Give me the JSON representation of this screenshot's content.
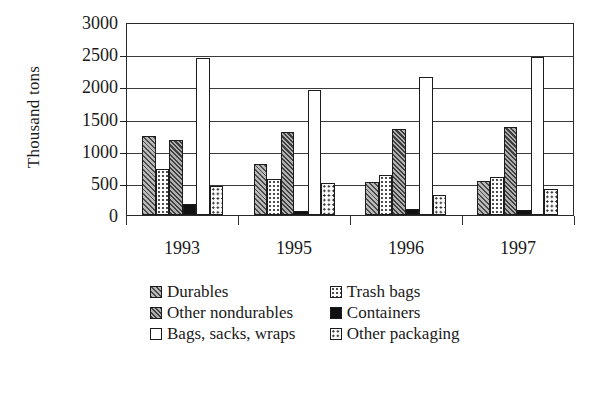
{
  "chart_data": {
    "type": "bar",
    "title": "",
    "subtitle": "",
    "xlabel": "",
    "ylabel": "Thousand tons",
    "categories": [
      "1993",
      "1995",
      "1996",
      "1997"
    ],
    "ylim": [
      0,
      3000
    ],
    "ytick_values": [
      3000,
      2500,
      2000,
      1500,
      1000,
      500,
      0
    ],
    "ytick_labels": [
      "3000",
      "2500",
      "2000",
      "1500",
      "1000",
      "500",
      "0"
    ],
    "grid": true,
    "grid_axis": "y",
    "legend_position": "below",
    "series": [
      {
        "name": "Durables",
        "pattern": "diagonal-hatch-dark",
        "values": [
          1230,
          800,
          520,
          530
        ]
      },
      {
        "name": "Trash bags",
        "pattern": "fine-dots-light",
        "values": [
          715,
          555,
          620,
          595
        ]
      },
      {
        "name": "Other nondurables",
        "pattern": "diagonal-hatch-dense",
        "values": [
          1160,
          1290,
          1340,
          1370
        ]
      },
      {
        "name": "Containers",
        "pattern": "solid-black",
        "values": [
          175,
          55,
          90,
          85
        ]
      },
      {
        "name": "Bags, sacks, wraps",
        "pattern": "solid-white",
        "values": [
          2440,
          1950,
          2150,
          2460
        ]
      },
      {
        "name": "Other packaging",
        "pattern": "coarse-dots",
        "values": [
          450,
          490,
          310,
          400
        ]
      }
    ]
  },
  "legend": {
    "items": [
      {
        "label": "Durables"
      },
      {
        "label": "Trash bags"
      },
      {
        "label": "Other nondurables"
      },
      {
        "label": "Containers"
      },
      {
        "label": "Bags, sacks, wraps"
      },
      {
        "label": "Other packaging"
      }
    ]
  },
  "colors": {
    "axis": "#2a2a2a",
    "grid": "#3b3b3b",
    "containers_fill": "#111111",
    "background": "#ffffff"
  }
}
